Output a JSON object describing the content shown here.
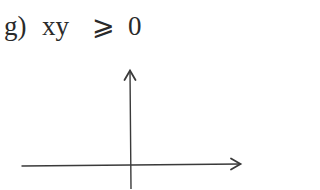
{
  "problem": {
    "letter": "g)",
    "expression": "xy",
    "operator": "⩾",
    "value": "0"
  },
  "diagram": {
    "type": "coordinate-axes",
    "stroke_color": "#3a3a3a",
    "x_axis": {
      "x1": 22,
      "y1": 166,
      "x2": 240,
      "y2": 164,
      "arrow": "right"
    },
    "y_axis": {
      "x1": 131,
      "y1": 189,
      "x2": 130,
      "y2": 71,
      "arrow": "up"
    },
    "origin": {
      "x": 131,
      "y": 165
    }
  }
}
